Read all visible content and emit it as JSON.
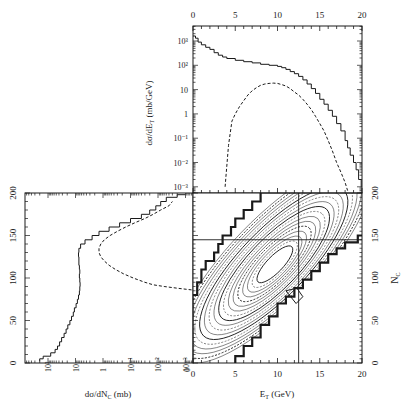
{
  "figure": {
    "background": "#ffffff",
    "ink": "#1a1a1a"
  },
  "chart_data": [
    {
      "id": "top",
      "type": "line",
      "title": "",
      "xlabel": "",
      "ylabel": "dσ/dE_T (mb/GeV)",
      "xscale": "linear",
      "yscale": "log",
      "xlim": [
        0,
        20
      ],
      "ylim": [
        0.0005,
        3000
      ],
      "x_ticks": [
        0,
        5,
        10,
        15,
        20
      ],
      "x_tick_labels": [
        "0",
        "5",
        "10",
        "15",
        "20"
      ],
      "x_tick_position": "top",
      "y_ticks": [
        1000,
        100,
        10,
        1,
        0.1,
        0.01,
        0.001
      ],
      "y_tick_labels": [
        "10³",
        "10²",
        "10",
        "1",
        "10⁻¹",
        "10⁻²",
        "10⁻³"
      ],
      "grid": false,
      "series": [
        {
          "name": "solid",
          "style": "solid",
          "x": [
            0,
            0.3,
            0.6,
            1,
            1.5,
            2,
            2.5,
            3,
            3.5,
            4,
            5,
            6,
            7,
            8,
            9,
            10,
            10.5,
            11,
            11.5,
            12,
            12.5,
            13,
            13.5,
            14,
            14.5,
            15,
            15.5,
            16,
            16.5,
            17,
            17.5,
            18,
            18.3,
            18.6,
            19,
            19.3,
            19.6,
            19.9
          ],
          "y": [
            1600,
            1300,
            900,
            700,
            550,
            450,
            330,
            260,
            220,
            190,
            160,
            140,
            125,
            110,
            100,
            90,
            80,
            68,
            55,
            45,
            35,
            25,
            17,
            11,
            7,
            4,
            2.5,
            1.4,
            0.8,
            0.4,
            0.2,
            0.08,
            0.04,
            0.02,
            0.01,
            0.005,
            0.002,
            0.001
          ]
        },
        {
          "name": "dashed",
          "style": "dashed",
          "x": [
            3.8,
            4.2,
            4.6,
            5,
            5.5,
            6,
            6.5,
            7,
            7.5,
            8,
            8.5,
            9,
            9.5,
            10,
            10.5,
            11,
            11.5,
            12,
            12.5,
            13,
            13.5,
            14,
            14.5,
            15,
            15.5,
            16,
            16.5,
            17,
            17.5,
            18,
            18.3
          ],
          "y": [
            0.001,
            0.05,
            0.5,
            1.0,
            2.0,
            3.5,
            6,
            9,
            12,
            15,
            17,
            18,
            18.5,
            18,
            16,
            14,
            11,
            8,
            6,
            4,
            2.5,
            1.5,
            0.8,
            0.4,
            0.2,
            0.08,
            0.03,
            0.01,
            0.004,
            0.0015,
            0.0007
          ]
        }
      ]
    },
    {
      "id": "left",
      "type": "line",
      "title": "",
      "xlabel": "dσ/dN_C (mb)",
      "ylabel": "",
      "xscale": "log",
      "yscale": "linear",
      "x_reversed": true,
      "xlim": [
        300,
        0.0005
      ],
      "ylim": [
        0,
        200
      ],
      "x_ticks": [
        100,
        10,
        1,
        0.1,
        0.01,
        0.001
      ],
      "x_tick_labels": [
        "10²",
        "10",
        "1",
        "10⁻¹",
        "10⁻²",
        "10⁻³"
      ],
      "x_end_label": "0",
      "y_ticks": [
        0,
        50,
        100,
        150,
        200
      ],
      "y_tick_labels": [
        "0",
        "50",
        "100",
        "150",
        "200"
      ],
      "grid": false,
      "series": [
        {
          "name": "solid",
          "style": "solid",
          "Nc": [
            2,
            5,
            8,
            12,
            16,
            20,
            25,
            30,
            35,
            40,
            45,
            50,
            55,
            60,
            65,
            70,
            75,
            80,
            85,
            90,
            95,
            100,
            105,
            110,
            115,
            120,
            125,
            130,
            135,
            140,
            145,
            150,
            155,
            160,
            165,
            170,
            175,
            180,
            185,
            190,
            195,
            198
          ],
          "value": [
            200,
            150,
            80,
            55,
            45,
            38,
            32,
            26,
            22,
            19,
            16,
            14,
            12,
            11,
            9.5,
            8.5,
            7.8,
            7.2,
            7.0,
            6.8,
            7.0,
            7.2,
            7.0,
            7.2,
            7.5,
            7.5,
            7.8,
            7.5,
            6.5,
            4.5,
            2.5,
            1.4,
            0.6,
            0.25,
            0.1,
            0.04,
            0.02,
            0.012,
            0.008,
            0.005,
            0.002,
            0.001
          ]
        },
        {
          "name": "dashed",
          "style": "dashed",
          "Nc": [
            86,
            88,
            90,
            92,
            95,
            100,
            105,
            110,
            115,
            120,
            125,
            130,
            135,
            140,
            145,
            150,
            155,
            160,
            165,
            170,
            175,
            180,
            185,
            190
          ],
          "value": [
            0.0006,
            0.002,
            0.006,
            0.015,
            0.03,
            0.08,
            0.18,
            0.35,
            0.6,
            0.9,
            1.2,
            1.4,
            1.4,
            1.2,
            0.9,
            0.55,
            0.3,
            0.15,
            0.07,
            0.03,
            0.015,
            0.008,
            0.004,
            0.003
          ]
        }
      ]
    },
    {
      "id": "main",
      "type": "contour",
      "title": "",
      "xlabel": "E_T (GeV)",
      "ylabel": "N_C",
      "xlim": [
        0,
        20
      ],
      "ylim": [
        0,
        200
      ],
      "x_ticks": [
        0,
        5,
        10,
        15,
        20
      ],
      "x_tick_labels": [
        "0",
        "5",
        "10",
        "15",
        "20"
      ],
      "y_ticks": [
        0,
        50,
        100,
        150,
        200
      ],
      "y_tick_labels": [
        "0",
        "50",
        "100",
        "150",
        "200"
      ],
      "y_tick_position": "right",
      "reference_lines": {
        "vertical_ET": 12.5,
        "horizontal_Nc": 145
      },
      "contour_levels": 18,
      "description": "Nested contours of d²σ/dE_T dN_C along a diagonal ridge from (E_T≈1, N_C≈20) to (E_T≈17, N_C≈190), with a thick step-like lower-left and lower-right boundary."
    }
  ],
  "labels": {
    "top_ylabel_main": "dσ/dE",
    "top_ylabel_sub": "T",
    "top_ylabel_unit": " (mb/GeV)",
    "left_xlabel_main": "dσ/dN",
    "left_xlabel_sub": "C",
    "left_xlabel_unit": " (mb)",
    "main_xlabel_main": "E",
    "main_xlabel_sub": "T",
    "main_xlabel_unit": " (GeV)",
    "main_ylabel_main": "N",
    "main_ylabel_sub": "C"
  }
}
